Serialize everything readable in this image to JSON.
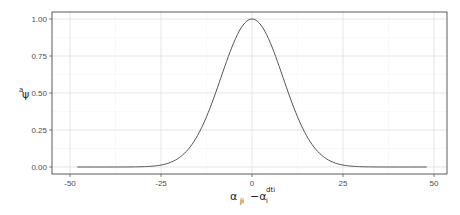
{
  "chart_data": {
    "type": "line",
    "title": "",
    "xlabel": "α_ji − α_i^dti",
    "ylabel": "ψ^a",
    "xlim": [
      -52,
      52
    ],
    "ylim": [
      -0.03,
      1.05
    ],
    "grid": true,
    "legend": null,
    "x_ticks": [
      -50,
      -25,
      0,
      25,
      50
    ],
    "x_tick_labels": [
      "-50",
      "-25",
      "0",
      "25",
      "50"
    ],
    "y_ticks": [
      0,
      0.25,
      0.5,
      0.75,
      1.0
    ],
    "y_tick_labels": [
      "0.00",
      "0.25",
      "0.50",
      "0.75",
      "1.00"
    ],
    "line_color": "#555555",
    "series": [
      {
        "name": "psi",
        "x": [
          -48,
          -45,
          -40,
          -35,
          -30,
          -27.5,
          -25,
          -22.5,
          -20,
          -17.5,
          -15,
          -12.5,
          -10,
          -7.5,
          -5,
          -2.5,
          0,
          2.5,
          5,
          7.5,
          10,
          12.5,
          15,
          17.5,
          20,
          22.5,
          25,
          27.5,
          30,
          35,
          40,
          45,
          48
        ],
        "values": [
          0.0,
          0.0,
          0.0,
          0.0,
          0.002,
          0.006,
          0.013,
          0.03,
          0.063,
          0.12,
          0.211,
          0.339,
          0.5,
          0.677,
          0.841,
          0.958,
          1.0,
          0.958,
          0.841,
          0.677,
          0.5,
          0.339,
          0.211,
          0.12,
          0.063,
          0.03,
          0.013,
          0.006,
          0.002,
          0.0,
          0.0,
          0.0,
          0.0
        ]
      }
    ]
  },
  "axes": {
    "y_title_main": "ψ",
    "y_title_sup": "a",
    "x_title_part1": "α",
    "x_title_sub1": "ji",
    "x_title_minus": "−α",
    "x_title_sup2": "dti",
    "x_title_sub2": "i"
  }
}
